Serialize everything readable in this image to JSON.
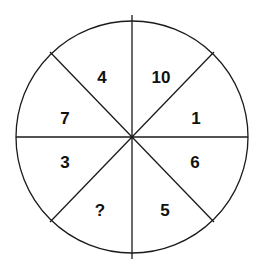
{
  "puzzle": {
    "shape": "circle divided into 8 sectors",
    "sectors": [
      {
        "position": "top-left-upper",
        "value": "4"
      },
      {
        "position": "top-right-upper",
        "value": "10"
      },
      {
        "position": "left-upper",
        "value": "7"
      },
      {
        "position": "right-upper",
        "value": "1"
      },
      {
        "position": "left-lower",
        "value": "3"
      },
      {
        "position": "right-lower",
        "value": "6"
      },
      {
        "position": "bottom-left-lower",
        "value": "?"
      },
      {
        "position": "bottom-right-lower",
        "value": "5"
      }
    ]
  },
  "colors": {
    "stroke": "#1a1a1a",
    "background": "#ffffff",
    "text": "#111111"
  }
}
